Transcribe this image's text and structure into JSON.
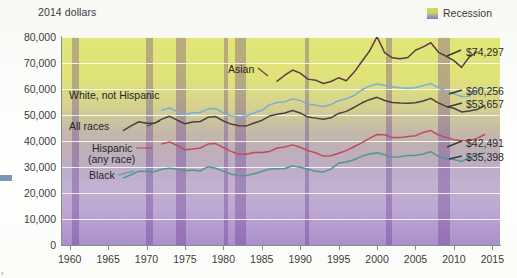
{
  "axis": {
    "y_title": "2014 dollars",
    "y_ticks": [
      "80,000",
      "70,000",
      "60,000",
      "50,000",
      "40,000",
      "30,000",
      "20,000",
      "10,000",
      "0"
    ],
    "x_ticks": [
      "1960",
      "1965",
      "1970",
      "1975",
      "1980",
      "1985",
      "1990",
      "1995",
      "2000",
      "2005",
      "2010",
      "2015"
    ]
  },
  "legend": {
    "recession_label": "Recession",
    "swatch_name": "recession-swatch"
  },
  "series_names": {
    "asian": "Asian",
    "white": "White, not Hispanic",
    "all": "All races",
    "hispanic_line1": "Hispanic",
    "hispanic_line2": "(any race)",
    "black": "Black"
  },
  "end_labels": {
    "asian": "$74,297",
    "white": "$60,256",
    "all": "$53,657",
    "hispanic": "$42,491",
    "black": "$35,398"
  },
  "colors": {
    "asian": "#5d3a48",
    "white": "#79aed6",
    "all": "#4a4040",
    "hispanic": "#c04a5e",
    "black": "#4f998e",
    "recession": "#6d3fa0",
    "band_top": "#e2e778",
    "band_bottom": "#ab90cc"
  },
  "chart_data": {
    "type": "line",
    "title": "",
    "subtitle": "",
    "xlabel": "",
    "ylabel": "2014 dollars",
    "xlim": [
      1959,
      2016
    ],
    "ylim": [
      0,
      80000
    ],
    "grid": "horizontal",
    "legend_position": "top-right",
    "annotations": [
      {
        "text": "Recession",
        "type": "legend-swatch"
      },
      {
        "text": "$74,297",
        "series": "Asian",
        "at_year": 2013
      },
      {
        "text": "$60,256",
        "series": "White, not Hispanic",
        "at_year": 2014
      },
      {
        "text": "$53,657",
        "series": "All races",
        "at_year": 2014
      },
      {
        "text": "$42,491",
        "series": "Hispanic (any race)",
        "at_year": 2014
      },
      {
        "text": "$35,398",
        "series": "Black",
        "at_year": 2014
      }
    ],
    "recession_bands": [
      [
        1960.3,
        1961.2
      ],
      [
        1969.9,
        1970.8
      ],
      [
        1973.9,
        1975.2
      ],
      [
        1980.1,
        1980.6
      ],
      [
        1981.5,
        1982.9
      ],
      [
        1990.6,
        1991.2
      ],
      [
        2001.2,
        2001.9
      ],
      [
        2007.9,
        2009.5
      ]
    ],
    "series": [
      {
        "name": "Asian",
        "color": "#5d3a48",
        "x": [
          1987,
          1988,
          1989,
          1990,
          1991,
          1992,
          1993,
          1994,
          1995,
          1996,
          1997,
          1998,
          1999,
          2000,
          2001,
          2002,
          2003,
          2004,
          2005,
          2006,
          2007,
          2008,
          2009,
          2010,
          2011,
          2012,
          2013
        ],
        "values": [
          63000,
          65300,
          67300,
          66100,
          63800,
          63400,
          62100,
          62900,
          64300,
          63200,
          66400,
          70500,
          74500,
          80100,
          73900,
          72000,
          71600,
          72100,
          74900,
          76200,
          77800,
          74100,
          72600,
          70900,
          68300,
          72300,
          74297
        ]
      },
      {
        "name": "White, not Hispanic",
        "color": "#79aed6",
        "x": [
          1972,
          1973,
          1974,
          1975,
          1976,
          1977,
          1978,
          1979,
          1980,
          1981,
          1982,
          1983,
          1984,
          1985,
          1986,
          1987,
          1988,
          1989,
          1990,
          1991,
          1992,
          1993,
          1994,
          1995,
          1996,
          1997,
          1998,
          1999,
          2000,
          2001,
          2002,
          2003,
          2004,
          2005,
          2006,
          2007,
          2008,
          2009,
          2010,
          2011,
          2012,
          2013,
          2014
        ],
        "values": [
          51800,
          52700,
          51300,
          50200,
          50900,
          51000,
          52300,
          52500,
          50700,
          49700,
          49200,
          49600,
          50900,
          51800,
          53900,
          54800,
          55100,
          56200,
          55600,
          54100,
          53800,
          53200,
          54000,
          55500,
          56300,
          57500,
          59600,
          61100,
          61900,
          61400,
          60800,
          60500,
          60300,
          60500,
          61300,
          62100,
          60400,
          59200,
          58200,
          57100,
          57200,
          59500,
          60256
        ]
      },
      {
        "name": "All races",
        "color": "#4a4040",
        "x": [
          1967,
          1968,
          1969,
          1970,
          1971,
          1972,
          1973,
          1974,
          1975,
          1976,
          1977,
          1978,
          1979,
          1980,
          1981,
          1982,
          1983,
          1984,
          1985,
          1986,
          1987,
          1988,
          1989,
          1990,
          1991,
          1992,
          1993,
          1994,
          1995,
          1996,
          1997,
          1998,
          1999,
          2000,
          2001,
          2002,
          2003,
          2004,
          2005,
          2006,
          2007,
          2008,
          2009,
          2010,
          2011,
          2012,
          2013,
          2014
        ],
        "values": [
          44100,
          45800,
          47400,
          46800,
          46800,
          48400,
          49500,
          48000,
          46600,
          47300,
          47500,
          49100,
          49400,
          47700,
          46500,
          45900,
          45800,
          46900,
          47900,
          49600,
          50300,
          50800,
          51700,
          50800,
          49200,
          48800,
          48400,
          48900,
          50600,
          51400,
          52900,
          54600,
          55900,
          56800,
          55600,
          54800,
          54600,
          54500,
          54700,
          55400,
          56400,
          54600,
          53300,
          52600,
          51200,
          51500,
          52100,
          53657
        ]
      },
      {
        "name": "Hispanic (any race)",
        "color": "#c04a5e",
        "x": [
          1972,
          1973,
          1974,
          1975,
          1976,
          1977,
          1978,
          1979,
          1980,
          1981,
          1982,
          1983,
          1984,
          1985,
          1986,
          1987,
          1988,
          1989,
          1990,
          1991,
          1992,
          1993,
          1994,
          1995,
          1996,
          1997,
          1998,
          1999,
          2000,
          2001,
          2002,
          2003,
          2004,
          2005,
          2006,
          2007,
          2008,
          2009,
          2010,
          2011,
          2012,
          2013,
          2014
        ],
        "values": [
          38900,
          39600,
          38300,
          36600,
          36900,
          37300,
          38800,
          39000,
          37500,
          36000,
          34900,
          34900,
          35600,
          35600,
          36000,
          37300,
          37700,
          38500,
          37600,
          36300,
          35500,
          34200,
          34300,
          35300,
          36300,
          37800,
          39300,
          41000,
          42500,
          42400,
          41300,
          41300,
          41700,
          42000,
          43300,
          44000,
          42300,
          41400,
          40500,
          40200,
          40100,
          41000,
          42491
        ]
      },
      {
        "name": "Black",
        "color": "#4f998e",
        "x": [
          1967,
          1968,
          1969,
          1970,
          1971,
          1972,
          1973,
          1974,
          1975,
          1976,
          1977,
          1978,
          1979,
          1980,
          1981,
          1982,
          1983,
          1984,
          1985,
          1986,
          1987,
          1988,
          1989,
          1990,
          1991,
          1992,
          1993,
          1994,
          1995,
          1996,
          1997,
          1998,
          1999,
          2000,
          2001,
          2002,
          2003,
          2004,
          2005,
          2006,
          2007,
          2008,
          2009,
          2010,
          2011,
          2012,
          2013,
          2014
        ],
        "values": [
          25800,
          27000,
          28400,
          28300,
          28200,
          29100,
          29500,
          29100,
          28600,
          28800,
          28500,
          30100,
          29500,
          28400,
          27300,
          26600,
          26700,
          27400,
          28300,
          29200,
          29300,
          29400,
          30400,
          29900,
          29100,
          28400,
          28100,
          29200,
          31500,
          31900,
          32800,
          34100,
          35000,
          35500,
          34700,
          33800,
          33900,
          34400,
          34400,
          35000,
          35900,
          34100,
          33300,
          32900,
          32100,
          33600,
          34600,
          35398
        ]
      }
    ]
  }
}
